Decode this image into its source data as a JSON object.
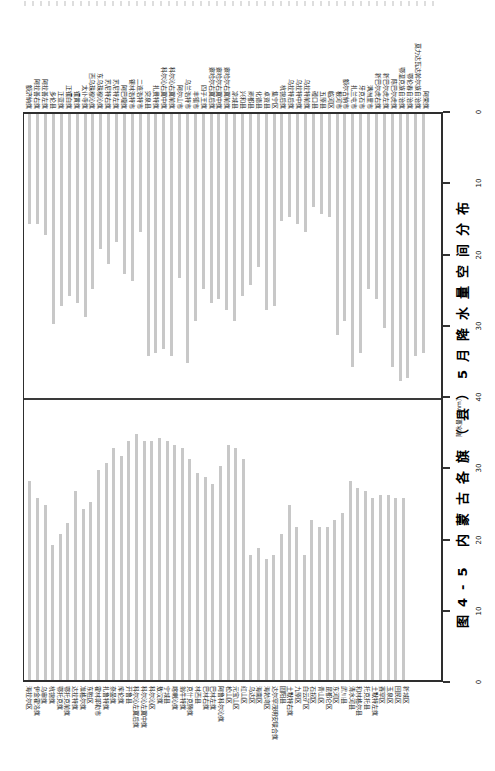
{
  "figure": {
    "caption": "图4-5 内蒙古各旗（县）5月降水量空间分布",
    "axis_title": "降水量（mm）",
    "tick_labels": [
      "0",
      "10",
      "20",
      "30",
      "40",
      "30",
      "20",
      "10",
      "0"
    ]
  },
  "chart_data": {
    "type": "bar",
    "title": "图4-5 内蒙古各旗（县）5月降水量空间分布",
    "ylabel": "降水量（mm）",
    "unit": "mm",
    "ylim": [
      0,
      40
    ],
    "axis_ticks": [
      0,
      10,
      20,
      30,
      40
    ],
    "grid": false,
    "legend": "none",
    "layout_note": "landscape two-panel mirrored bar chart rotated 90° to fit portrait page; upper panel bars hang from top baseline, lower panel bars rise from bottom baseline, shared 40mm midline, value axis on right edge",
    "bar_color": "#c8c8c8",
    "panels": [
      {
        "name": "upper",
        "categories": [
          "额济纳旗",
          "阿拉善右旗",
          "阿拉善左旗",
          "多伦县",
          "正蓝旗",
          "正镶白旗",
          "镶黄旗",
          "太仆寺旗",
          "西乌珠穆沁旗",
          "东乌珠穆沁旗",
          "苏尼特右旗",
          "苏尼特左旗",
          "阿巴嘎旗",
          "锡林浩特市",
          "二连浩特市",
          "突泉县",
          "扎赉特旗",
          "科尔沁右翼中旗",
          "科尔沁右翼前旗",
          "阿尔山市",
          "乌兰浩特市",
          "丰镇市",
          "四子王旗",
          "察哈尔右翼后旗",
          "察哈尔右翼中旗",
          "察哈尔右翼前旗",
          "凉城县",
          "兴和县",
          "商都县",
          "化德县",
          "卓资县",
          "集宁区",
          "杭锦后旗",
          "乌拉特后旗",
          "乌拉特中旗",
          "乌拉特前旗",
          "磴口县",
          "五原县",
          "临河区",
          "根河市",
          "额尔古纳市",
          "扎兰屯市",
          "牙克石市",
          "满洲里市",
          "新巴尔虎右旗",
          "新巴尔虎左旗",
          "陈巴尔虎旗",
          "鄂温克族自治旗",
          "鄂伦春自治旗",
          "莫力达瓦达斡尔族自治旗",
          "阿荣旗"
        ],
        "values": [
          15.5,
          15.5,
          17,
          29.5,
          27,
          25.5,
          26.5,
          28.5,
          24.5,
          19,
          21,
          18,
          22.5,
          23.5,
          16.5,
          34,
          33.5,
          33,
          34,
          23,
          35,
          29,
          24.5,
          26.5,
          26,
          27.5,
          29,
          25.5,
          24,
          21.5,
          27.5,
          27,
          15,
          14.5,
          15.5,
          16.5,
          13,
          14,
          14.5,
          31,
          29,
          35.5,
          33.5,
          24.5,
          26,
          30,
          35.5,
          37.5,
          37,
          34,
          33.5
        ]
      },
      {
        "name": "lower",
        "categories": [
          "海拉尔区",
          "伊金霍洛旗",
          "乌审旗",
          "杭锦旗",
          "鄂托克旗",
          "鄂托克前旗",
          "达拉特旗",
          "准格尔旗",
          "东胜区",
          "霍林郭勒市",
          "扎鲁特旗",
          "奈曼旗",
          "库伦旗",
          "开鲁县",
          "科尔沁左翼后旗",
          "科尔沁左翼中旗",
          "科尔沁区",
          "敖汉旗",
          "宁城县",
          "喀喇沁旗",
          "翁牛特旗",
          "克什克腾旗",
          "林西县",
          "巴林右旗",
          "巴林左旗",
          "阿鲁科尔沁旗",
          "松山区",
          "元宝山区",
          "红山区",
          "乌达区",
          "海南区",
          "海勃湾区",
          "达尔罕茂明安联合旗",
          "固阳县",
          "土默特右旗",
          "九原区",
          "白云矿区",
          "石拐区",
          "青山区",
          "昆都仑区",
          "东河区",
          "武川县",
          "清水河县",
          "和林格尔县",
          "托克托县",
          "土默特左旗",
          "赛罕区",
          "玉泉区",
          "回民区",
          "新城区"
        ],
        "values": [
          28,
          25.5,
          24.5,
          19,
          20.5,
          22,
          26.5,
          24,
          25,
          29.5,
          30.5,
          32.5,
          31.5,
          33.5,
          34.5,
          33.5,
          33.5,
          34,
          33.5,
          33,
          32.5,
          31,
          29,
          28.5,
          27.5,
          30,
          33,
          32.5,
          31,
          17.5,
          18.5,
          17,
          17.5,
          20.5,
          24.5,
          21.5,
          17.5,
          22.5,
          21.5,
          21.5,
          22.5,
          23.5,
          28,
          27,
          26.5,
          25.5,
          26,
          26,
          25.5,
          25.5
        ]
      }
    ]
  }
}
